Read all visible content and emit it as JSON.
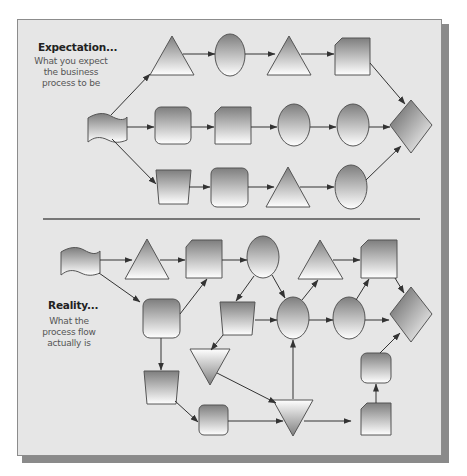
{
  "expectation": {
    "title": "Expectation...",
    "subtitle_lines": [
      "What you expect",
      "the business",
      "process to be"
    ]
  },
  "reality": {
    "title": "Reality...",
    "subtitle_lines": [
      "What the",
      "process flow",
      "actually is"
    ]
  },
  "colors": {
    "panel_bg": "#e6e6e6",
    "shape_dark": "#808080",
    "shape_light": "#ffffff",
    "stroke": "#555555",
    "arrow": "#333333",
    "divider": "#777777",
    "shadow": "#8a8a8a"
  },
  "shapes": {
    "expectation": [
      {
        "id": "e_start",
        "type": "document"
      },
      {
        "id": "e_tri1",
        "type": "triangle"
      },
      {
        "id": "e_circ1",
        "type": "ellipse"
      },
      {
        "id": "e_tri2",
        "type": "triangle"
      },
      {
        "id": "e_card1",
        "type": "card"
      },
      {
        "id": "e_rrect1",
        "type": "rounded-rect"
      },
      {
        "id": "e_card2",
        "type": "card"
      },
      {
        "id": "e_circ2",
        "type": "ellipse"
      },
      {
        "id": "e_circ3",
        "type": "ellipse"
      },
      {
        "id": "e_diamond",
        "type": "diamond"
      },
      {
        "id": "e_trap1",
        "type": "trapezoid"
      },
      {
        "id": "e_rrect2",
        "type": "rounded-rect"
      },
      {
        "id": "e_tri3",
        "type": "triangle"
      },
      {
        "id": "e_circ4",
        "type": "ellipse"
      }
    ],
    "reality": [
      {
        "id": "r_start",
        "type": "document"
      },
      {
        "id": "r_tri1",
        "type": "triangle"
      },
      {
        "id": "r_card1",
        "type": "card"
      },
      {
        "id": "r_circ1",
        "type": "ellipse"
      },
      {
        "id": "r_tri2",
        "type": "triangle"
      },
      {
        "id": "r_card2",
        "type": "card"
      },
      {
        "id": "r_rrect1",
        "type": "rounded-rect"
      },
      {
        "id": "r_trap1",
        "type": "trapezoid"
      },
      {
        "id": "r_circ2",
        "type": "ellipse"
      },
      {
        "id": "r_circ3",
        "type": "ellipse"
      },
      {
        "id": "r_diamond",
        "type": "diamond"
      },
      {
        "id": "r_invtri1",
        "type": "inverted-triangle"
      },
      {
        "id": "r_trap2",
        "type": "trapezoid"
      },
      {
        "id": "r_rrect2",
        "type": "rounded-rect"
      },
      {
        "id": "r_invtri2",
        "type": "inverted-triangle"
      },
      {
        "id": "r_card3",
        "type": "card"
      },
      {
        "id": "r_rrect3",
        "type": "rounded-rect"
      }
    ]
  }
}
